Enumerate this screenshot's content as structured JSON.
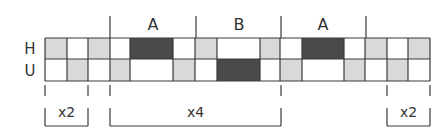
{
  "diagram": {
    "row_labels": [
      "H",
      "U"
    ],
    "colors": {
      "white": "#ffffff",
      "light": "#d9d9d9",
      "dark": "#4a4a4a",
      "line": "#3a3a3a",
      "text": "#333333"
    },
    "grid": {
      "top": 38,
      "mid": 59,
      "bottom": 81,
      "columns": [
        {
          "x0": 45,
          "x1": 67,
          "H": "light",
          "U": "white"
        },
        {
          "x0": 67,
          "x1": 88,
          "H": "white",
          "U": "light"
        },
        {
          "x0": 88,
          "x1": 110,
          "H": "light",
          "U": "white"
        },
        {
          "x0": 110,
          "x1": 130,
          "H": "white",
          "U": "light"
        },
        {
          "x0": 130,
          "x1": 173,
          "H": "dark",
          "U": "white"
        },
        {
          "x0": 173,
          "x1": 195,
          "H": "white",
          "U": "light"
        },
        {
          "x0": 195,
          "x1": 217,
          "H": "light",
          "U": "white"
        },
        {
          "x0": 217,
          "x1": 260,
          "H": "white",
          "U": "dark"
        },
        {
          "x0": 260,
          "x1": 280,
          "H": "light",
          "U": "white"
        },
        {
          "x0": 280,
          "x1": 302,
          "H": "white",
          "U": "light"
        },
        {
          "x0": 302,
          "x1": 344,
          "H": "dark",
          "U": "white"
        },
        {
          "x0": 344,
          "x1": 365,
          "H": "white",
          "U": "light"
        },
        {
          "x0": 365,
          "x1": 387,
          "H": "light",
          "U": "white"
        },
        {
          "x0": 387,
          "x1": 408,
          "H": "white",
          "U": "light"
        },
        {
          "x0": 408,
          "x1": 430,
          "H": "light",
          "U": "white"
        }
      ]
    },
    "section_dividers": [
      110,
      196,
      281,
      366
    ],
    "sections": [
      {
        "label": "A",
        "x": 153
      },
      {
        "label": "B",
        "x": 239
      },
      {
        "label": "A",
        "x": 323
      }
    ],
    "brackets": [
      {
        "label": "x2",
        "x0": 45,
        "x1": 88
      },
      {
        "label": "x4",
        "x0": 110,
        "x1": 281
      },
      {
        "label": "x2",
        "x0": 387,
        "x1": 430
      }
    ]
  }
}
